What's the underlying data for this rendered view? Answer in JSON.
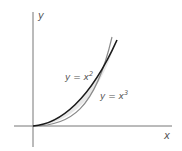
{
  "diagram": {
    "axis_labels": {
      "x": "x",
      "y": "y"
    },
    "curves": [
      {
        "name": "y = x^2",
        "label_base": "y = x",
        "label_exp": "2",
        "color": "#1a1a1a"
      },
      {
        "name": "y = x^3",
        "label_base": "y = x",
        "label_exp": "3",
        "color": "#8a8a8a"
      }
    ],
    "region_fill": "#e8e8e8",
    "axis_color": "#777777"
  }
}
